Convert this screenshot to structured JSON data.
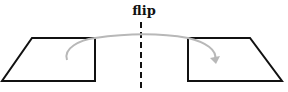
{
  "diagram": {
    "label": "flip",
    "colors": {
      "shape_stroke": "#111111",
      "arrow": "#b8b8b8",
      "axis": "#111111"
    },
    "left_shape": {
      "points": "32,38 95,38 95,81 2,81"
    },
    "right_shape": {
      "points": "188,38 250,38 282,81 188,81"
    }
  }
}
